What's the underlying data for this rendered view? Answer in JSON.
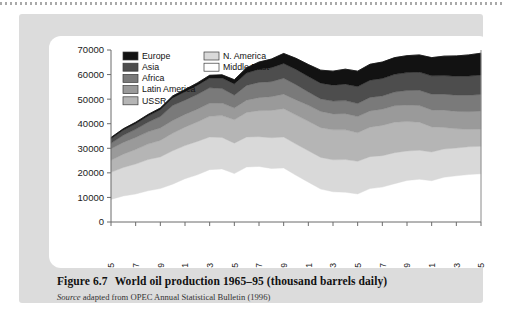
{
  "figure": {
    "number_label": "Figure 6.7",
    "title": "World oil production 1965–95 (thousand barrels daily)",
    "source_word": "Source",
    "source_text": "adapted from OPEC Annual Statistical Bulletin (1996)"
  },
  "chart_data": {
    "type": "area",
    "title": "World oil production 1965–95 (thousand barrels daily)",
    "xlabel": "",
    "ylabel": "",
    "units": "thousand barrels daily",
    "stacked": true,
    "grid": false,
    "legend_position": "top-left-inside",
    "xlim": [
      1965,
      1995
    ],
    "ylim": [
      0,
      70000
    ],
    "ytick_values": [
      0,
      10000,
      20000,
      30000,
      40000,
      50000,
      60000,
      70000
    ],
    "ytick_labels": [
      "0",
      "10000",
      "20000",
      "30000",
      "40000",
      "50000",
      "60000",
      "70000"
    ],
    "xtick_values": [
      1965,
      1967,
      1969,
      1971,
      1973,
      1975,
      1977,
      1979,
      1981,
      1983,
      1985,
      1987,
      1989,
      1991,
      1993,
      1995
    ],
    "xtick_labels": [
      "1965",
      "1967",
      "1969",
      "1971",
      "1973",
      "1975",
      "1977",
      "1979",
      "1981",
      "1983",
      "1985",
      "1987",
      "1989",
      "1991",
      "1993",
      "1995"
    ],
    "x": [
      1965,
      1966,
      1967,
      1968,
      1969,
      1970,
      1971,
      1972,
      1973,
      1974,
      1975,
      1976,
      1977,
      1978,
      1979,
      1980,
      1981,
      1982,
      1983,
      1984,
      1985,
      1986,
      1987,
      1988,
      1989,
      1990,
      1991,
      1992,
      1993,
      1994,
      1995
    ],
    "stack_order_bottom_to_top": [
      "Middle East",
      "N. America",
      "USSR",
      "Latin America",
      "Africa",
      "Asia",
      "Europe"
    ],
    "series": [
      {
        "name": "Middle East",
        "color": "#ffffff",
        "values": [
          9200,
          10600,
          11400,
          12700,
          13600,
          15400,
          17600,
          19200,
          21300,
          21600,
          19700,
          22400,
          22600,
          21800,
          22000,
          19000,
          16200,
          13400,
          12300,
          12100,
          11400,
          13600,
          14200,
          15600,
          16900,
          17400,
          16800,
          18200,
          18800,
          19300,
          19600
        ]
      },
      {
        "name": "N. America",
        "color": "#d9d9d9",
        "values": [
          11000,
          11600,
          12200,
          12700,
          12900,
          13600,
          13500,
          13600,
          13300,
          12800,
          12400,
          12200,
          12100,
          12500,
          12600,
          12700,
          12800,
          12900,
          13000,
          13300,
          13300,
          13000,
          12800,
          12600,
          12000,
          11800,
          11700,
          11500,
          11300,
          11300,
          11200
        ]
      },
      {
        "name": "USSR",
        "color": "#b5b5b5",
        "values": [
          4900,
          5400,
          5900,
          6300,
          6700,
          7100,
          7500,
          7900,
          8400,
          8900,
          9500,
          10000,
          10600,
          11100,
          11500,
          11800,
          12000,
          12100,
          12200,
          12100,
          11600,
          12000,
          12300,
          12400,
          12000,
          11400,
          10200,
          8800,
          7800,
          7100,
          7000
        ]
      },
      {
        "name": "Latin America",
        "color": "#9a9a9a",
        "values": [
          4700,
          4800,
          4900,
          5000,
          5100,
          5200,
          5200,
          5200,
          5300,
          5100,
          4800,
          5000,
          5300,
          5600,
          5900,
          6200,
          6500,
          6600,
          6500,
          6600,
          6600,
          6600,
          6600,
          6700,
          6700,
          6800,
          6900,
          7000,
          7100,
          7200,
          7300
        ]
      },
      {
        "name": "Africa",
        "color": "#7a7a7a",
        "values": [
          2200,
          2900,
          3300,
          3900,
          4600,
          6100,
          5800,
          6000,
          6300,
          5900,
          5200,
          6000,
          6200,
          6100,
          6500,
          6200,
          5400,
          5100,
          5200,
          5300,
          5300,
          5500,
          5400,
          5600,
          5900,
          6200,
          6400,
          6500,
          6600,
          6700,
          6800
        ]
      },
      {
        "name": "Asia",
        "color": "#4d4d4d",
        "values": [
          1900,
          2100,
          2300,
          2500,
          2800,
          3100,
          3400,
          3700,
          4000,
          4300,
          4600,
          5000,
          5400,
          5700,
          6000,
          6200,
          6300,
          6400,
          6500,
          6700,
          6900,
          7000,
          7100,
          7200,
          7300,
          7400,
          7500,
          7600,
          7700,
          7800,
          7900
        ]
      },
      {
        "name": "Europe",
        "color": "#121212",
        "values": [
          500,
          550,
          600,
          650,
          700,
          800,
          900,
          1000,
          1100,
          1300,
          1700,
          2200,
          2900,
          3500,
          4100,
          4500,
          4900,
          5300,
          5700,
          6100,
          6300,
          6500,
          6700,
          6800,
          6900,
          7000,
          7400,
          7900,
          8300,
          8600,
          8900
        ]
      }
    ],
    "totals": [
      34400,
      37950,
      40600,
      43750,
      46400,
      51300,
      53900,
      56600,
      59700,
      59900,
      57900,
      62800,
      65100,
      66300,
      68600,
      66600,
      64100,
      61800,
      61400,
      62200,
      61400,
      64200,
      65100,
      66900,
      67700,
      68000,
      66900,
      67500,
      67600,
      68000,
      68700
    ],
    "legend_columns": [
      [
        "Europe",
        "Asia",
        "Africa",
        "Latin America",
        "USSR"
      ],
      [
        "N. America",
        "Middle East"
      ]
    ]
  }
}
